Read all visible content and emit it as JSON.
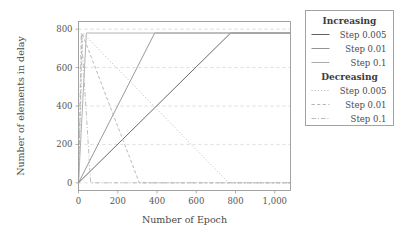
{
  "chart_data": {
    "type": "line",
    "title": "",
    "xlabel": "Number of Epoch",
    "ylabel": "Number of elements in delay",
    "xlim": [
      0,
      1080
    ],
    "ylim": [
      -40,
      840
    ],
    "xticks": [
      0,
      200,
      400,
      600,
      800,
      1000
    ],
    "xticklabels": [
      "0",
      "200",
      "400",
      "600",
      "800",
      "1,000"
    ],
    "yticks": [
      0,
      200,
      400,
      600,
      800
    ],
    "yticklabels": [
      "0",
      "200",
      "400",
      "600",
      "800"
    ],
    "grid": "horizontal-dashed",
    "legend_position": "right-outside",
    "series": [
      {
        "name": "Increasing Step 0.005",
        "group": "Increasing",
        "label": "Step 0.005",
        "style": "solid",
        "color": "#585858",
        "width": 0.9,
        "x": [
          0,
          775,
          1080
        ],
        "y": [
          0,
          780,
          780
        ]
      },
      {
        "name": "Increasing Step 0.01",
        "group": "Increasing",
        "label": "Step 0.01",
        "style": "solid",
        "color": "#8d8d8d",
        "width": 0.9,
        "x": [
          0,
          388,
          1080
        ],
        "y": [
          0,
          780,
          780
        ]
      },
      {
        "name": "Increasing Step 0.1",
        "group": "Increasing",
        "label": "Step 0.1",
        "style": "solid",
        "color": "#a8a8a8",
        "width": 0.9,
        "x": [
          0,
          40,
          1080
        ],
        "y": [
          0,
          780,
          780
        ]
      },
      {
        "name": "Decreasing Step 0.005",
        "group": "Decreasing",
        "label": "Step 0.005",
        "style": "dotted",
        "color": "#b0b0b0",
        "width": 0.9,
        "x": [
          0,
          22,
          765,
          1080
        ],
        "y": [
          0,
          780,
          0,
          0
        ]
      },
      {
        "name": "Decreasing Step 0.01",
        "group": "Decreasing",
        "label": "Step 0.01",
        "style": "dashed",
        "color": "#b0b0b0",
        "width": 0.9,
        "x": [
          0,
          18,
          310,
          1080
        ],
        "y": [
          0,
          780,
          0,
          0
        ]
      },
      {
        "name": "Decreasing Step 0.1",
        "group": "Decreasing",
        "label": "Step 0.1",
        "style": "dashdot",
        "color": "#b8b8b8",
        "width": 0.9,
        "x": [
          0,
          14,
          62,
          1080
        ],
        "y": [
          0,
          780,
          0,
          0
        ]
      }
    ]
  },
  "legend": {
    "groups": [
      {
        "header": "Increasing",
        "entries": [
          {
            "label": "Step 0.005",
            "style": "solid",
            "color": "#585858"
          },
          {
            "label": "Step 0.01",
            "style": "solid",
            "color": "#8d8d8d"
          },
          {
            "label": "Step 0.1",
            "style": "solid",
            "color": "#a8a8a8"
          }
        ]
      },
      {
        "header": "Decreasing",
        "entries": [
          {
            "label": "Step 0.005",
            "style": "dotted",
            "color": "#b0b0b0"
          },
          {
            "label": "Step 0.01",
            "style": "dashed",
            "color": "#b0b0b0"
          },
          {
            "label": "Step 0.1",
            "style": "dashdot",
            "color": "#b8b8b8"
          }
        ]
      }
    ]
  }
}
